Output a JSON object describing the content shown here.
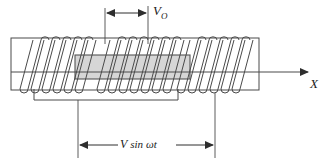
{
  "figure": {
    "background_color": "#ffffff",
    "line_color": "#3a3a3a",
    "core_fill_color": "#d4d4d4",
    "core_stroke_color": "#555555"
  },
  "labels": {
    "amplitude": "V",
    "amplitude_subscript": "O",
    "axis": "X",
    "source_v": "V",
    "source_sin": "sin",
    "source_omega_t": "ωt",
    "source_full": "V sin ωt"
  },
  "geometry": {
    "tube": {
      "x": 11,
      "y": 38,
      "width": 248,
      "height": 52
    },
    "core": {
      "x": 75,
      "y": 55,
      "width": 115,
      "height": 24
    },
    "axis_line": {
      "x1": 11,
      "y1": 72,
      "x2": 312,
      "y2": 72
    },
    "top_dimension": {
      "x1": 105,
      "x2": 148,
      "y": 13
    },
    "bottom_dimension": {
      "x1": 78,
      "x2": 215,
      "y": 145
    },
    "circuit_wire": {
      "x1": 34,
      "x2": 178,
      "y": 100
    }
  },
  "coils": {
    "groups": [
      {
        "name": "left-coil",
        "start": 33,
        "turns": 6,
        "pitch": 11,
        "slant": 13
      },
      {
        "name": "middle-coil",
        "start": 110,
        "turns": 7,
        "pitch": 11,
        "slant": 13
      },
      {
        "name": "right-coil",
        "start": 190,
        "turns": 6,
        "pitch": 11,
        "slant": 13
      }
    ],
    "top_y": 40,
    "bottom_y": 89
  }
}
